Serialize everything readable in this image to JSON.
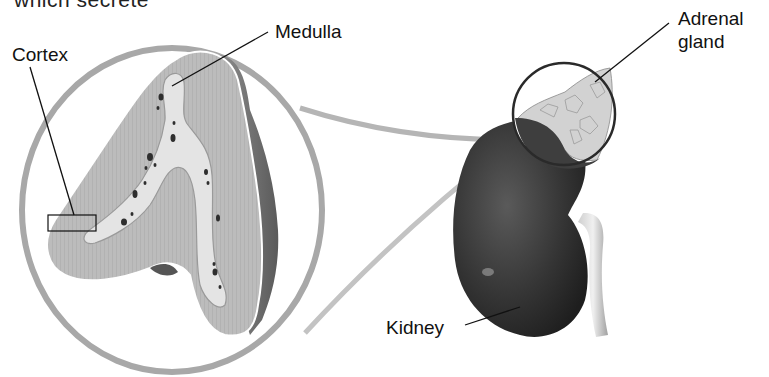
{
  "figure": {
    "top_cutoff_text": "which secrete",
    "labels": {
      "cortex": "Cortex",
      "medulla": "Medulla",
      "adrenal_gland_line1": "Adrenal",
      "adrenal_gland_line2": "gland",
      "kidney": "Kidney"
    },
    "colors": {
      "background": "#ffffff",
      "magnifier_ring": "#a8a8a8",
      "cortex_fill": "#bdbdbd",
      "medulla_fill": "#e0e0e0",
      "capsule_shadow": "#6e6e6e",
      "kidney_fill": "#3a3a3a",
      "adrenal_fill": "#d4d4d4",
      "leader_line": "#111111"
    }
  }
}
